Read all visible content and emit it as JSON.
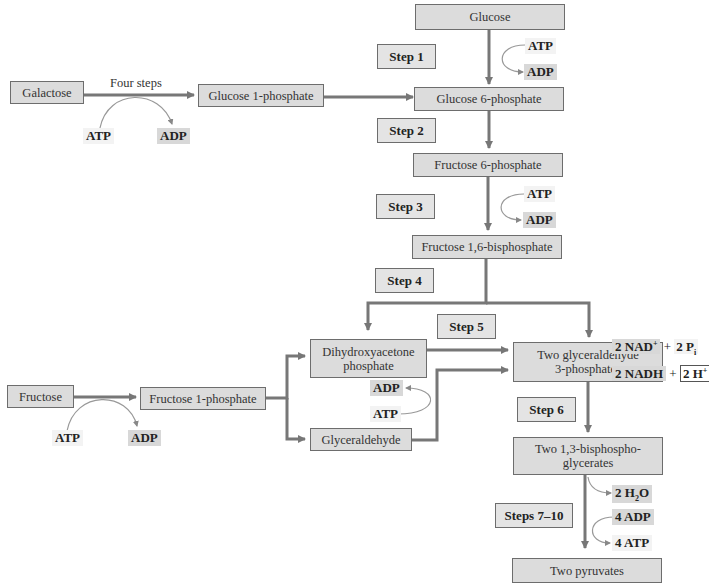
{
  "diagram": {
    "type": "metabolic-pathway-flowchart",
    "title": "",
    "molecules": {
      "glucose": "Glucose",
      "glucose6p": "Glucose 6-phosphate",
      "fructose6p": "Fructose 6-phosphate",
      "fructose16bp": "Fructose 1,6-bisphosphate",
      "dhap_line1": "Dihydroxyacetone",
      "dhap_line2": "phosphate",
      "g3p_line1": "Two glyceraldehyde",
      "g3p_line2": "3-phosphates",
      "bpg_line1": "Two 1,3-bisphospho-",
      "bpg_line2": "glycerates",
      "pyruvates": "Two pyruvates",
      "galactose": "Galactose",
      "glucose1p": "Glucose 1-phosphate",
      "fructose": "Fructose",
      "fructose1p": "Fructose 1-phosphate",
      "glyceraldehyde": "Glyceraldehyde"
    },
    "steps": {
      "s1": "Step 1",
      "s2": "Step 2",
      "s3": "Step 3",
      "s4": "Step 4",
      "s5": "Step 5",
      "s6": "Step 6",
      "s7_10": "Steps 7–10"
    },
    "annotations": {
      "four_steps": "Four steps",
      "atp": "ATP",
      "adp": "ADP",
      "nad_prefix": "2 NAD",
      "nad_sup": "+",
      "plus": "+",
      "pi_prefix": "2 P",
      "pi_sub": "i",
      "nadh": "2 NADH",
      "h_prefix": "2 H",
      "h_sup": "+",
      "h2o_prefix": "2 H",
      "h2o_sub": "2",
      "h2o_suffix": "O",
      "four_adp": "4 ADP",
      "four_atp": "4 ATP"
    },
    "colors": {
      "box_fill": "#dcdcdc",
      "box_border": "#6d6d6d",
      "arrow": "#777777",
      "cofactor_highlight": "#d8d8d8"
    }
  }
}
